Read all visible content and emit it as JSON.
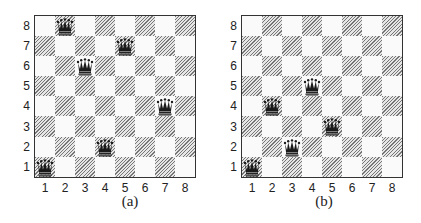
{
  "figures": [
    {
      "caption": "(a)",
      "size": 8,
      "rank_labels": [
        "8",
        "7",
        "6",
        "5",
        "4",
        "3",
        "2",
        "1"
      ],
      "file_labels": [
        "1",
        "2",
        "3",
        "4",
        "5",
        "6",
        "7",
        "8"
      ],
      "queens": [
        {
          "col": 1,
          "row": 1
        },
        {
          "col": 2,
          "row": 8
        },
        {
          "col": 3,
          "row": 6
        },
        {
          "col": 4,
          "row": 2
        },
        {
          "col": 5,
          "row": 7
        },
        {
          "col": 7,
          "row": 4
        }
      ]
    },
    {
      "caption": "(b)",
      "size": 8,
      "rank_labels": [
        "8",
        "7",
        "6",
        "5",
        "4",
        "3",
        "2",
        "1"
      ],
      "file_labels": [
        "1",
        "2",
        "3",
        "4",
        "5",
        "6",
        "7",
        "8"
      ],
      "queens": [
        {
          "col": 1,
          "row": 1
        },
        {
          "col": 2,
          "row": 4
        },
        {
          "col": 3,
          "row": 2
        },
        {
          "col": 4,
          "row": 5
        },
        {
          "col": 5,
          "row": 3
        }
      ]
    }
  ],
  "piece_icon": "queen-icon",
  "colors": {
    "dark_square_hatch": "#777777",
    "light_square": "#fafafa",
    "border": "#333333",
    "piece": "#1a1a1a"
  }
}
